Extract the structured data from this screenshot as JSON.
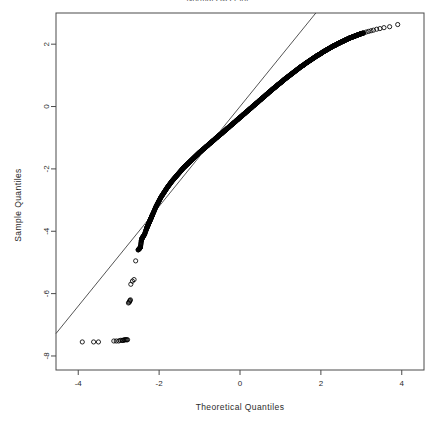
{
  "chart_title": "Normal Q-Q Plot",
  "axes": {
    "xlabel": "Theoretical Quantiles",
    "ylabel": "Sample Quantiles",
    "xticks": [
      "-4",
      "-2",
      "0",
      "2",
      "4"
    ],
    "xtick_values": [
      -4,
      -2,
      0,
      2,
      4
    ],
    "yticks": [
      "2",
      "0",
      "-2",
      "-4",
      "-6",
      "-8"
    ],
    "ytick_values": [
      2,
      0,
      -2,
      -4,
      -6,
      -8
    ],
    "xlim": [
      -4.55,
      4.55
    ],
    "ylim": [
      -8.45,
      3.0
    ],
    "grid": false
  },
  "style": {
    "point_color": "#000000",
    "line_color": "#2a2a2a",
    "frame_color": "#4a4a4a",
    "background": "#ffffff",
    "point_radius": 2.1,
    "point_marker": "open-circle"
  },
  "reference_line": {
    "slope": 1.6,
    "intercept": 0.0,
    "description": "qqline through 1st and 3rd quartiles"
  },
  "chart_data": {
    "type": "scatter",
    "title": "Normal Q-Q Plot",
    "xlabel": "Theoretical Quantiles",
    "ylabel": "Sample Quantiles",
    "xlim": [
      -4.55,
      4.55
    ],
    "ylim": [
      -8.45,
      3.0
    ],
    "grid": false,
    "legend": null,
    "series": [
      {
        "name": "Sample Quantiles vs Theoretical Quantiles",
        "marker": "open-circle",
        "x": [
          -3.9,
          -3.62,
          -3.5,
          -3.12,
          -3.06,
          -3.0,
          -2.96,
          -2.92,
          -2.9,
          -2.88,
          -2.86,
          -2.84,
          -2.82,
          -2.8,
          -2.78,
          -2.76,
          -2.74,
          -2.73,
          -2.72,
          -2.71,
          -2.7,
          -2.66,
          -2.62,
          -2.58,
          -2.52,
          -2.48,
          -2.46,
          -2.44,
          -2.42,
          -2.4,
          -2.36,
          -2.32,
          -2.3,
          -2.28,
          -2.26,
          -2.24,
          -2.22,
          -2.2,
          -2.18,
          -2.16,
          -2.12,
          -2.08,
          -2.04,
          -2.0,
          -1.96,
          -1.92,
          -1.88,
          -1.84,
          -1.8,
          -1.76,
          -1.72,
          -1.68,
          -1.64,
          -1.6,
          -1.56,
          -1.52,
          -1.48,
          -1.44,
          -1.4,
          -1.36,
          -1.32,
          -1.28,
          -1.24,
          -1.2,
          -1.16,
          -1.12,
          -1.08,
          -1.04,
          -1.0,
          -0.96,
          -0.92,
          -0.88,
          -0.84,
          -0.8,
          -0.76,
          -0.72,
          -0.68,
          -0.64,
          -0.6,
          -0.56,
          -0.52,
          -0.48,
          -0.44,
          -0.4,
          -0.36,
          -0.32,
          -0.28,
          -0.24,
          -0.2,
          -0.16,
          -0.12,
          -0.08,
          -0.04,
          0.0,
          0.04,
          0.08,
          0.12,
          0.16,
          0.2,
          0.24,
          0.28,
          0.32,
          0.36,
          0.4,
          0.44,
          0.48,
          0.52,
          0.56,
          0.6,
          0.64,
          0.68,
          0.72,
          0.76,
          0.8,
          0.84,
          0.88,
          0.92,
          0.96,
          1.0,
          1.04,
          1.08,
          1.12,
          1.16,
          1.2,
          1.24,
          1.28,
          1.32,
          1.36,
          1.4,
          1.44,
          1.48,
          1.52,
          1.56,
          1.6,
          1.64,
          1.68,
          1.72,
          1.76,
          1.8,
          1.84,
          1.88,
          1.92,
          1.96,
          2.0,
          2.04,
          2.08,
          2.12,
          2.16,
          2.2,
          2.24,
          2.28,
          2.32,
          2.36,
          2.4,
          2.44,
          2.48,
          2.52,
          2.56,
          2.6,
          2.64,
          2.68,
          2.72,
          2.76,
          2.8,
          2.84,
          2.88,
          2.92,
          2.96,
          3.0,
          3.06,
          3.12,
          3.18,
          3.24,
          3.3,
          3.38,
          3.46,
          3.56,
          3.7,
          3.9
        ],
        "y": [
          -7.55,
          -7.55,
          -7.55,
          -7.52,
          -7.52,
          -7.52,
          -7.5,
          -7.5,
          -7.5,
          -7.5,
          -7.48,
          -7.48,
          -7.48,
          -7.48,
          -7.48,
          -6.3,
          -6.28,
          -6.25,
          -6.22,
          -6.2,
          -5.7,
          -5.6,
          -5.55,
          -4.95,
          -4.6,
          -4.55,
          -4.5,
          -4.3,
          -4.22,
          -4.18,
          -4.1,
          -3.95,
          -3.88,
          -3.82,
          -3.76,
          -3.7,
          -3.64,
          -3.58,
          -3.52,
          -3.46,
          -3.34,
          -3.22,
          -3.12,
          -3.02,
          -2.92,
          -2.84,
          -2.76,
          -2.68,
          -2.6,
          -2.53,
          -2.46,
          -2.39,
          -2.33,
          -2.27,
          -2.21,
          -2.15,
          -2.09,
          -2.03,
          -1.97,
          -1.92,
          -1.87,
          -1.82,
          -1.77,
          -1.72,
          -1.67,
          -1.62,
          -1.57,
          -1.52,
          -1.47,
          -1.43,
          -1.38,
          -1.34,
          -1.29,
          -1.25,
          -1.2,
          -1.16,
          -1.11,
          -1.07,
          -1.02,
          -0.98,
          -0.93,
          -0.89,
          -0.85,
          -0.8,
          -0.76,
          -0.71,
          -0.67,
          -0.62,
          -0.58,
          -0.53,
          -0.49,
          -0.44,
          -0.4,
          -0.35,
          -0.31,
          -0.26,
          -0.22,
          -0.17,
          -0.13,
          -0.08,
          -0.04,
          0.01,
          0.05,
          0.1,
          0.14,
          0.19,
          0.23,
          0.28,
          0.32,
          0.37,
          0.41,
          0.46,
          0.5,
          0.55,
          0.59,
          0.63,
          0.68,
          0.72,
          0.76,
          0.8,
          0.85,
          0.89,
          0.93,
          0.97,
          1.01,
          1.05,
          1.09,
          1.13,
          1.17,
          1.21,
          1.25,
          1.29,
          1.32,
          1.36,
          1.4,
          1.43,
          1.47,
          1.5,
          1.54,
          1.57,
          1.61,
          1.64,
          1.67,
          1.7,
          1.74,
          1.77,
          1.8,
          1.83,
          1.86,
          1.89,
          1.92,
          1.95,
          1.97,
          2.0,
          2.03,
          2.05,
          2.08,
          2.1,
          2.13,
          2.15,
          2.18,
          2.2,
          2.22,
          2.24,
          2.26,
          2.28,
          2.3,
          2.32,
          2.34,
          2.36,
          2.39,
          2.41,
          2.43,
          2.45,
          2.48,
          2.5,
          2.53,
          2.56,
          2.63
        ]
      }
    ],
    "annotations": [
      {
        "text": "Lower tail censored/floored cluster near y = -7.5",
        "x": -2.9,
        "y": -7.5
      },
      {
        "text": "Points bow below the reference line in the lower tail",
        "x": -2.0,
        "y": -3.5
      },
      {
        "text": "Upper-tail outliers rise above the reference line",
        "x": 3.7,
        "y": 2.6
      }
    ]
  }
}
